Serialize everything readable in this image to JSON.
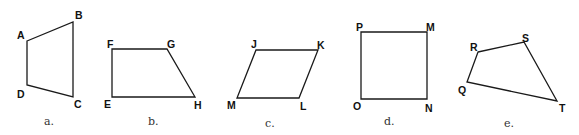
{
  "figure": {
    "shapes": [
      {
        "id": "a",
        "caption": "a.",
        "type": "quadrilateral",
        "vertices": [
          {
            "label": "A",
            "x": 27,
            "y": 41,
            "lx": 17,
            "ly": 39
          },
          {
            "label": "B",
            "x": 73,
            "y": 22,
            "lx": 75,
            "ly": 19
          },
          {
            "label": "C",
            "x": 73,
            "y": 97,
            "lx": 74,
            "ly": 108
          },
          {
            "label": "D",
            "x": 27,
            "y": 85,
            "lx": 17,
            "ly": 98
          }
        ],
        "caption_pos": {
          "x": 44,
          "y": 125
        }
      },
      {
        "id": "b",
        "caption": "b.",
        "type": "trapezoid",
        "vertices": [
          {
            "label": "F",
            "x": 112,
            "y": 49,
            "lx": 107,
            "ly": 48
          },
          {
            "label": "G",
            "x": 167,
            "y": 49,
            "lx": 167,
            "ly": 48
          },
          {
            "label": "H",
            "x": 195,
            "y": 97,
            "lx": 194,
            "ly": 109
          },
          {
            "label": "E",
            "x": 112,
            "y": 97,
            "lx": 104,
            "ly": 108
          }
        ],
        "caption_pos": {
          "x": 148,
          "y": 125
        }
      },
      {
        "id": "c",
        "caption": "c.",
        "type": "parallelogram",
        "vertices": [
          {
            "label": "J",
            "x": 256,
            "y": 50,
            "lx": 251,
            "ly": 48
          },
          {
            "label": "K",
            "x": 318,
            "y": 50,
            "lx": 317,
            "ly": 49
          },
          {
            "label": "L",
            "x": 299,
            "y": 98,
            "lx": 300,
            "ly": 110
          },
          {
            "label": "M",
            "x": 237,
            "y": 98,
            "lx": 227,
            "ly": 109
          }
        ],
        "caption_pos": {
          "x": 265,
          "y": 127
        }
      },
      {
        "id": "d",
        "caption": "d.",
        "type": "square",
        "vertices": [
          {
            "label": "P",
            "x": 361,
            "y": 32,
            "lx": 356,
            "ly": 31
          },
          {
            "label": "M",
            "x": 427,
            "y": 32,
            "lx": 426,
            "ly": 31
          },
          {
            "label": "N",
            "x": 427,
            "y": 99,
            "lx": 425,
            "ly": 112
          },
          {
            "label": "O",
            "x": 361,
            "y": 99,
            "lx": 353,
            "ly": 110
          }
        ],
        "caption_pos": {
          "x": 384,
          "y": 125
        }
      },
      {
        "id": "e",
        "caption": "e.",
        "type": "quadrilateral",
        "vertices": [
          {
            "label": "R",
            "x": 478,
            "y": 52,
            "lx": 470,
            "ly": 51
          },
          {
            "label": "S",
            "x": 524,
            "y": 42,
            "lx": 522,
            "ly": 42
          },
          {
            "label": "T",
            "x": 557,
            "y": 101,
            "lx": 559,
            "ly": 112
          },
          {
            "label": "Q",
            "x": 467,
            "y": 82,
            "lx": 458,
            "ly": 94
          }
        ],
        "caption_pos": {
          "x": 504,
          "y": 127
        }
      }
    ]
  }
}
